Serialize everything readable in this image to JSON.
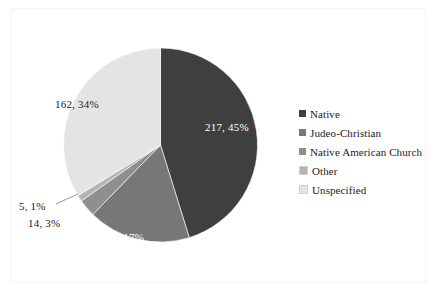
{
  "chart_data": {
    "type": "pie",
    "title": "",
    "subtitle": "",
    "xlabel": "",
    "ylabel": "",
    "grid": false,
    "legend_position": "right",
    "total": 480,
    "categories": [
      "Native",
      "Judeo-Christian",
      "Native American Church",
      "Other",
      "Unspecified"
    ],
    "values": [
      217,
      82,
      14,
      5,
      162
    ],
    "percents": [
      45,
      17,
      3,
      1,
      34
    ],
    "data_labels": [
      "217, 45%",
      "82, 17%",
      "14, 3%",
      "5, 1%",
      "162, 34%"
    ],
    "colors": [
      "#3f3f3f",
      "#777777",
      "#8f8f8f",
      "#b4b4b4",
      "#e4e4e4"
    ],
    "label_text_colors": [
      "#ffffff",
      "#ffffff",
      "#1a1a1a",
      "#1a1a1a",
      "#1a1a1a"
    ],
    "start_angle_deg": 0,
    "direction": "clockwise",
    "slices": [
      {
        "name": "Native",
        "value": 217,
        "percent": 45,
        "label": "217, 45%",
        "color": "#3f3f3f"
      },
      {
        "name": "Judeo-Christian",
        "value": 82,
        "percent": 17,
        "label": "82, 17%",
        "color": "#777777"
      },
      {
        "name": "Native American Church",
        "value": 14,
        "percent": 3,
        "label": "14, 3%",
        "color": "#8f8f8f"
      },
      {
        "name": "Other",
        "value": 5,
        "percent": 1,
        "label": "5, 1%",
        "color": "#b4b4b4"
      },
      {
        "name": "Unspecified",
        "value": 162,
        "percent": 34,
        "label": "162, 34%",
        "color": "#e4e4e4"
      }
    ]
  },
  "legend": {
    "items": [
      {
        "label": "Native",
        "color": "#3f3f3f"
      },
      {
        "label": "Judeo-Christian",
        "color": "#777777"
      },
      {
        "label": "Native American Church",
        "color": "#8f8f8f"
      },
      {
        "label": "Other",
        "color": "#b4b4b4"
      },
      {
        "label": "Unspecified",
        "color": "#e4e4e4"
      }
    ]
  }
}
